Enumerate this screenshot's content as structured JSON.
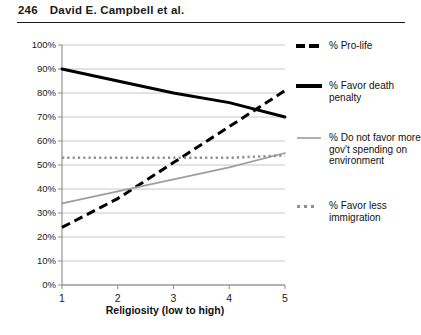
{
  "page": {
    "folio": "246",
    "running_head": "David E. Campbell et al."
  },
  "chart_data": {
    "type": "line",
    "title": "",
    "xlabel": "Religiosity (low to high)",
    "ylabel": "",
    "categories": [
      "1",
      "2",
      "3",
      "4",
      "5"
    ],
    "x": [
      1,
      2,
      3,
      4,
      5
    ],
    "xlim": [
      1,
      5
    ],
    "ylim": [
      0,
      100
    ],
    "ytick_labels": [
      "0%",
      "10%",
      "20%",
      "30%",
      "40%",
      "50%",
      "60%",
      "70%",
      "80%",
      "90%",
      "100%"
    ],
    "ytick_values": [
      0,
      10,
      20,
      30,
      40,
      50,
      60,
      70,
      80,
      90,
      100
    ],
    "grid": true,
    "legend_position": "right",
    "series": [
      {
        "name": "% Pro-life",
        "style": "dashed",
        "color": "#000000",
        "values": [
          24,
          36,
          51,
          66,
          81
        ]
      },
      {
        "name": "% Favor death penalty",
        "style": "solid",
        "color": "#000000",
        "values": [
          90,
          85,
          80,
          76,
          70
        ]
      },
      {
        "name": "% Do not favor more gov't spending on environment",
        "style": "thin-gray",
        "color": "#9e9e9e",
        "values": [
          34,
          39,
          44,
          49,
          55
        ]
      },
      {
        "name": "% Favor less immigration",
        "style": "dotted",
        "color": "#8f8f8f",
        "values": [
          53,
          53,
          53,
          53,
          54
        ]
      }
    ]
  },
  "legend": {
    "items": [
      {
        "label": "% Pro-life",
        "marker": "dashed-line-marker"
      },
      {
        "label": "% Favor death penalty",
        "marker": "solid-line-marker"
      },
      {
        "label": "% Do not favor more gov't spending on environment",
        "marker": "thin-gray-line-marker"
      },
      {
        "label": "% Favor less immigration",
        "marker": "dotted-line-marker"
      }
    ]
  }
}
